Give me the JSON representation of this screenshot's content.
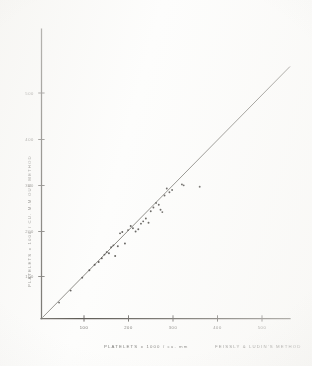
{
  "figure": {
    "kind": "scatter-plot-scan",
    "background_color": "#fdfdfc",
    "ink_color": "#3a3834"
  },
  "axes": {
    "x_axis_title_main": "PLATELETS x 1000  / cu. mm",
    "x_axis_title_method": "FEISSLY & LUDIN'S METHOD",
    "y_axis_title": "PLATELETS x 1000 / CU. M.M      OUR METHOD",
    "x_ticks": [
      "100",
      "200",
      "300",
      "400",
      "500"
    ],
    "y_ticks": [
      "500",
      "400",
      "300",
      "200",
      "100"
    ]
  },
  "chart_data": {
    "type": "scatter",
    "title": "",
    "subtitle": "",
    "xlabel": "PLATELETS x 1000 / cu. mm  —  FEISSLY & LUDIN'S METHOD",
    "ylabel": "PLATELETS x 1000 / CU. M.M  —  OUR METHOD",
    "xlim": [
      0,
      560
    ],
    "ylim": [
      0,
      560
    ],
    "xticks": [
      100,
      200,
      300,
      400,
      500
    ],
    "yticks": [
      100,
      200,
      300,
      400,
      500
    ],
    "grid": false,
    "legend_position": "none",
    "annotations": [],
    "reference_line": {
      "name": "identity-line",
      "description": "straight line of equality drawn from origin through the point cloud",
      "x": [
        0,
        555
      ],
      "y": [
        0,
        555
      ]
    },
    "series": [
      {
        "name": "paired platelet counts",
        "marker": "small filled dot",
        "color": "#35332f",
        "points": [
          [
            44,
            46
          ],
          [
            70,
            72
          ],
          [
            96,
            100
          ],
          [
            112,
            116
          ],
          [
            124,
            128
          ],
          [
            133,
            134
          ],
          [
            140,
            142
          ],
          [
            146,
            150
          ],
          [
            151,
            155
          ],
          [
            156,
            153
          ],
          [
            161,
            166
          ],
          [
            166,
            170
          ],
          [
            170,
            147
          ],
          [
            176,
            168
          ],
          [
            181,
            196
          ],
          [
            186,
            199
          ],
          [
            192,
            174
          ],
          [
            199,
            203
          ],
          [
            205,
            212
          ],
          [
            210,
            207
          ],
          [
            216,
            200
          ],
          [
            222,
            205
          ],
          [
            228,
            217
          ],
          [
            233,
            222
          ],
          [
            239,
            228
          ],
          [
            245,
            219
          ],
          [
            250,
            244
          ],
          [
            256,
            252
          ],
          [
            262,
            262
          ],
          [
            268,
            258
          ],
          [
            272,
            247
          ],
          [
            276,
            242
          ],
          [
            281,
            278
          ],
          [
            286,
            293
          ],
          [
            292,
            285
          ],
          [
            298,
            290
          ],
          [
            320,
            302
          ],
          [
            324,
            300
          ],
          [
            360,
            297
          ]
        ]
      }
    ]
  }
}
